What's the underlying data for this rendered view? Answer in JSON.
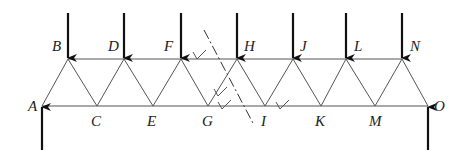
{
  "diagram": {
    "type": "truss",
    "joints": {
      "A": {
        "x": 42,
        "y": 106,
        "label_dx": -14,
        "label_dy": 5
      },
      "B": {
        "x": 68,
        "y": 59,
        "label_dx": -16,
        "label_dy": -8
      },
      "C": {
        "x": 97,
        "y": 106,
        "label_dx": -6,
        "label_dy": 20
      },
      "D": {
        "x": 124,
        "y": 59,
        "label_dx": -16,
        "label_dy": -8
      },
      "E": {
        "x": 153,
        "y": 106,
        "label_dx": -6,
        "label_dy": 20
      },
      "F": {
        "x": 181,
        "y": 59,
        "label_dx": -17,
        "label_dy": -8
      },
      "G": {
        "x": 208,
        "y": 106,
        "label_dx": -6,
        "label_dy": 20
      },
      "H": {
        "x": 237,
        "y": 59,
        "label_dx": 7,
        "label_dy": -8
      },
      "I": {
        "x": 265,
        "y": 106,
        "label_dx": -4,
        "label_dy": 20
      },
      "J": {
        "x": 293,
        "y": 59,
        "label_dx": 7,
        "label_dy": -8
      },
      "K": {
        "x": 321,
        "y": 106,
        "label_dx": -6,
        "label_dy": 20
      },
      "L": {
        "x": 346,
        "y": 59,
        "label_dx": 8,
        "label_dy": -8
      },
      "M": {
        "x": 375,
        "y": 106,
        "label_dx": -6,
        "label_dy": 20
      },
      "N": {
        "x": 402,
        "y": 59,
        "label_dx": 8,
        "label_dy": -8
      },
      "O": {
        "x": 428,
        "y": 106,
        "label_dx": 6,
        "label_dy": 5
      }
    },
    "members": [
      [
        "A",
        "C"
      ],
      [
        "C",
        "E"
      ],
      [
        "E",
        "G"
      ],
      [
        "G",
        "I"
      ],
      [
        "I",
        "K"
      ],
      [
        "K",
        "M"
      ],
      [
        "M",
        "O"
      ],
      [
        "B",
        "D"
      ],
      [
        "D",
        "F"
      ],
      [
        "F",
        "H"
      ],
      [
        "H",
        "J"
      ],
      [
        "J",
        "L"
      ],
      [
        "L",
        "N"
      ],
      [
        "A",
        "B"
      ],
      [
        "B",
        "C"
      ],
      [
        "C",
        "D"
      ],
      [
        "D",
        "E"
      ],
      [
        "E",
        "F"
      ],
      [
        "F",
        "G"
      ],
      [
        "G",
        "H"
      ],
      [
        "H",
        "I"
      ],
      [
        "I",
        "J"
      ],
      [
        "J",
        "K"
      ],
      [
        "K",
        "L"
      ],
      [
        "L",
        "M"
      ],
      [
        "M",
        "N"
      ],
      [
        "N",
        "O"
      ]
    ],
    "loads": [
      {
        "joint": "B",
        "direction": "down"
      },
      {
        "joint": "D",
        "direction": "down"
      },
      {
        "joint": "F",
        "direction": "down"
      },
      {
        "joint": "H",
        "direction": "down"
      },
      {
        "joint": "J",
        "direction": "down"
      },
      {
        "joint": "L",
        "direction": "down"
      },
      {
        "joint": "N",
        "direction": "down"
      }
    ],
    "reactions": [
      {
        "joint": "A",
        "direction": "up"
      },
      {
        "joint": "O",
        "direction": "up"
      }
    ],
    "section_cut": {
      "x1": 204,
      "y1": 30,
      "x2": 254,
      "y2": 125,
      "style": "dash-dot"
    },
    "check_marks": [
      {
        "x": 197,
        "y": 56,
        "member": "FH"
      },
      {
        "x": 218,
        "y": 93,
        "member": "GH"
      },
      {
        "x": 222,
        "y": 106,
        "member": "GI"
      },
      {
        "x": 280,
        "y": 106,
        "member": "IK"
      }
    ],
    "colors": {
      "member": "#555555",
      "arrow": "#111111",
      "cut": "#333333",
      "label": "#222222"
    }
  }
}
